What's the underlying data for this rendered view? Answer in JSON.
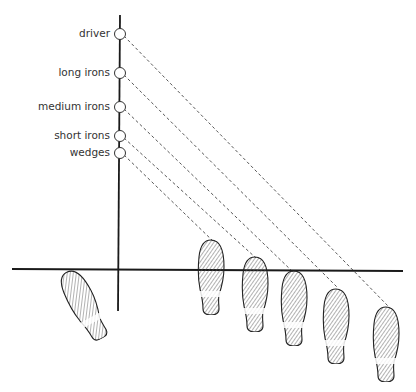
{
  "diagram": {
    "type": "golf ball position vs stance diagram",
    "clubs": [
      {
        "label": "driver",
        "y": 34,
        "target": [
          388,
          306
        ]
      },
      {
        "label": "long irons",
        "y": 73,
        "target": [
          338,
          288
        ]
      },
      {
        "label": "medium irons",
        "y": 107,
        "target": [
          293,
          272
        ]
      },
      {
        "label": "short irons",
        "y": 136,
        "target": [
          256,
          258
        ]
      },
      {
        "label": "wedges",
        "y": 153,
        "target": [
          214,
          242
        ]
      }
    ],
    "axis": {
      "x": 120,
      "top": 15,
      "bottom": 311
    },
    "ground_line": {
      "y": 269,
      "x1": 12,
      "x2": 403
    },
    "footprints": [
      {
        "name": "left-foot",
        "cx": 84,
        "cy": 305,
        "rotate": -28
      },
      {
        "name": "right-foot-1",
        "cx": 211,
        "cy": 277,
        "rotate": 0
      },
      {
        "name": "right-foot-2",
        "cx": 255,
        "cy": 294,
        "rotate": 0
      },
      {
        "name": "right-foot-3",
        "cx": 294,
        "cy": 308,
        "rotate": 0
      },
      {
        "name": "right-foot-4",
        "cx": 336,
        "cy": 326,
        "rotate": 0
      },
      {
        "name": "right-foot-5",
        "cx": 386,
        "cy": 344,
        "rotate": 0
      }
    ],
    "colors": {
      "line": "#1a1a1a",
      "dash": "#444444",
      "text": "#333333",
      "hatch": "#555555"
    }
  }
}
